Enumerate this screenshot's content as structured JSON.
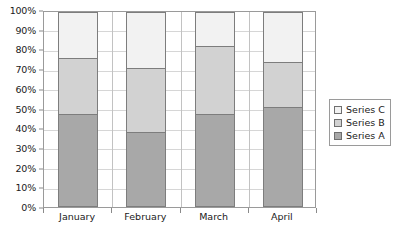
{
  "chart_data": {
    "type": "bar",
    "stacked": true,
    "title": "",
    "xlabel": "",
    "ylabel": "",
    "categories": [
      "January",
      "February",
      "March",
      "April"
    ],
    "series": [
      {
        "name": "Series A",
        "values": [
          47,
          38,
          47,
          51
        ],
        "color": "#a8a8a8"
      },
      {
        "name": "Series B",
        "values": [
          29,
          33,
          35,
          23
        ],
        "color": "#d2d2d2"
      },
      {
        "name": "Series C",
        "values": [
          24,
          29,
          18,
          26
        ],
        "color": "#f2f2f2"
      }
    ],
    "cumulative_tops": {
      "series_a": [
        47,
        38,
        47,
        51
      ],
      "series_b": [
        76,
        71,
        82,
        74
      ],
      "series_c": [
        100,
        100,
        100,
        100
      ]
    },
    "ylim": [
      0,
      100
    ],
    "ytick_labels": [
      "100%",
      "90%",
      "80%",
      "70%",
      "60%",
      "50%",
      "40%",
      "30%",
      "20%",
      "10%",
      "0%"
    ],
    "ytick_values": [
      100,
      90,
      80,
      70,
      60,
      50,
      40,
      30,
      20,
      10,
      0
    ],
    "grid": true,
    "legend_position": "right",
    "legend_entries": [
      "Series C",
      "Series B",
      "Series A"
    ]
  },
  "colors": {
    "series_a": "#a8a8a8",
    "series_b": "#d2d2d2",
    "series_c": "#f2f2f2",
    "gridline": "#d6d6d6",
    "axis": "#9a9a9a",
    "bar_border": "#7d7d7d",
    "background": "#ffffff"
  }
}
